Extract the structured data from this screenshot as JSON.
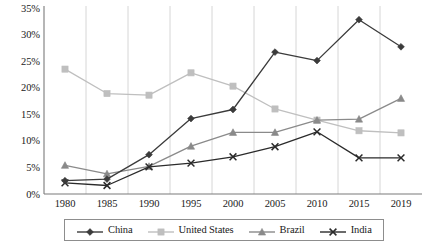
{
  "chart_data": {
    "type": "line",
    "title": "",
    "subtitle": "",
    "xlabel": "",
    "ylabel": "",
    "x": [
      "1980",
      "1985",
      "1990",
      "1995",
      "2000",
      "2005",
      "2010",
      "2015",
      "2019"
    ],
    "categories": [
      "1980",
      "1985",
      "1990",
      "1995",
      "2000",
      "2005",
      "2010",
      "2015",
      "2019"
    ],
    "ylim": [
      0,
      35
    ],
    "ytick_values": [
      0,
      5,
      10,
      15,
      20,
      25,
      30,
      35
    ],
    "ytick_labels": [
      "0%",
      "5%",
      "10%",
      "15%",
      "20%",
      "25%",
      "30%",
      "35%"
    ],
    "grid": "vertical",
    "legend_position": "bottom",
    "series": [
      {
        "name": "China",
        "marker": "diamond",
        "color": "#3b3b3b",
        "values": [
          2.5,
          2.8,
          7.4,
          14.2,
          15.9,
          26.7,
          25.1,
          32.8,
          27.7
        ]
      },
      {
        "name": "United States",
        "marker": "square",
        "color": "#bfbfbf",
        "values": [
          23.5,
          18.9,
          18.6,
          22.8,
          20.3,
          16.0,
          13.9,
          11.9,
          11.5
        ]
      },
      {
        "name": "Brazil",
        "marker": "triangle",
        "color": "#8a8a8a",
        "values": [
          5.4,
          3.8,
          5.2,
          9.0,
          11.6,
          11.6,
          13.9,
          14.1,
          18.0
        ]
      },
      {
        "name": "India",
        "marker": "x",
        "color": "#2b2b2b",
        "values": [
          2.1,
          1.6,
          5.1,
          5.8,
          7.0,
          8.9,
          11.7,
          6.8,
          6.8
        ]
      }
    ]
  },
  "legend": {
    "items": [
      {
        "label": "China"
      },
      {
        "label": "United States"
      },
      {
        "label": "Brazil"
      },
      {
        "label": "India"
      }
    ]
  },
  "axes": {
    "y_labels": [
      "35%",
      "30%",
      "25%",
      "20%",
      "15%",
      "10%",
      "5%",
      "0%"
    ],
    "x_labels": [
      "1980",
      "1985",
      "1990",
      "1995",
      "2000",
      "2005",
      "2010",
      "2015",
      "2019"
    ]
  },
  "colors": {
    "china": "#3b3b3b",
    "united_states": "#bfbfbf",
    "brazil": "#8a8a8a",
    "india": "#2b2b2b",
    "axis": "#7a7a7a",
    "gridline": "#cccccc",
    "background": "#ffffff"
  }
}
